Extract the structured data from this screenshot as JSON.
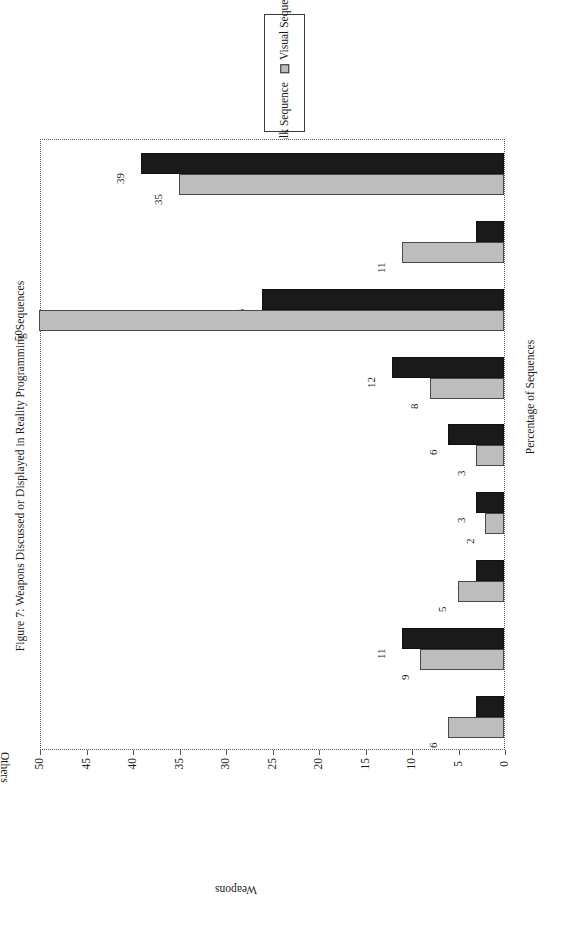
{
  "figure": {
    "title": "Figure 7: Weapons Discussed or Displayed in Reality Programming Sequences"
  },
  "legend": {
    "entries": [
      {
        "label": "Talk Sequence",
        "color": "#1a1a1a",
        "swatch": "talk-sequence-swatch"
      },
      {
        "label": "Visual Sequence",
        "color": "#bdbdbd",
        "swatch": "visual-sequence-swatch"
      }
    ]
  },
  "axes": {
    "value_axis_title": "Percentage of Sequences",
    "category_axis_title": "Weapons",
    "value_ticks": [
      "0",
      "5",
      "10",
      "15",
      "20",
      "25",
      "30",
      "35",
      "40",
      "45",
      "50"
    ]
  },
  "chart_data": {
    "type": "bar",
    "title": "Figure 7: Weapons Discussed or Displayed in Reality Programming Sequences",
    "orientation": "horizontal-rotated",
    "categories": [
      "Natural Means",
      "War Weapons",
      "Guns",
      "Knives",
      "Rope, Wire (strangling)",
      "Poisons, Chemicals",
      "Bombs (nonmilitary)",
      "Devices",
      "Others"
    ],
    "series": [
      {
        "name": "Talk Sequence",
        "color": "#1a1a1a",
        "values": [
          39,
          3,
          26,
          12,
          6,
          3,
          3,
          11,
          3
        ]
      },
      {
        "name": "Visual Sequence",
        "color": "#bdbdbd",
        "values": [
          35,
          11,
          50,
          8,
          3,
          2,
          5,
          9,
          6
        ]
      }
    ],
    "xlabel": "Weapons",
    "ylabel": "Percentage of Sequences",
    "ylim": [
      0,
      50
    ],
    "ytick_step": 5,
    "grid": false,
    "legend_position": "top-center",
    "data_labels": true
  }
}
